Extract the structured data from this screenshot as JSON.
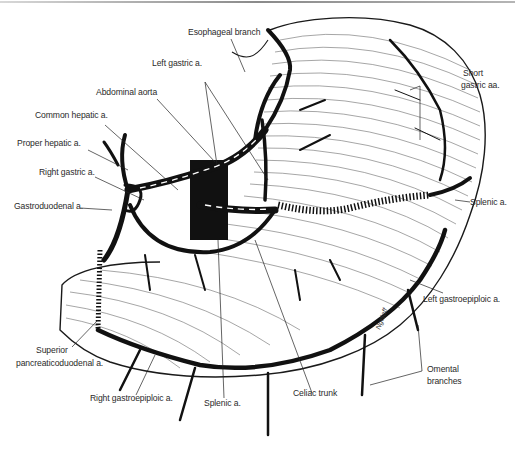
{
  "figure": {
    "signature": "Ngelaff",
    "colors": {
      "ink": "#111111",
      "hatch": "#6a6a6a",
      "label": "#2a2a2a",
      "background": "#ffffff"
    }
  },
  "labels": {
    "esophageal_branch": "Esophageal branch",
    "left_gastric": "Left gastric a.",
    "abdominal_aorta": "Abdominal aorta",
    "common_hepatic": "Common hepatic a.",
    "proper_hepatic": "Proper hepatic a.",
    "right_gastric": "Right gastric a.",
    "gastroduodenal": "Gastroduodenal a.",
    "short_gastric_line1": "Short",
    "short_gastric_line2": "gastric aa.",
    "splenic_right": "Splenic a.",
    "left_gastroepiploic": "Left gastroepiploic a.",
    "omental_line1": "Omental",
    "omental_line2": "branches",
    "superior_pd_line1": "Superior",
    "superior_pd_line2": "pancreaticoduodenal a.",
    "right_gastroepiploic": "Right gastroepiploic a.",
    "splenic_bottom": "Splenic a.",
    "celiac_trunk": "Celiac trunk"
  }
}
